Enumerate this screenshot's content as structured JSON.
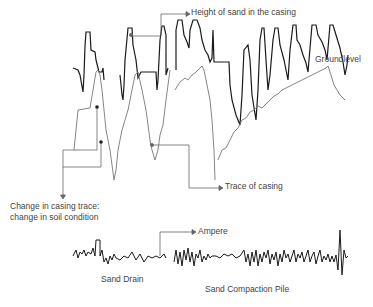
{
  "diagram": {
    "labels": {
      "height_of_sand": "Height of sand in the casing",
      "ground_level": "Groundlevel",
      "trace_of_casing": "Trace of casing",
      "change_line1": "Change in casing trace:",
      "change_line2": "change in soil condition",
      "ampere": "Ampere",
      "sand_drain": "Sand Drain",
      "sand_compaction_pile": "Sand Compaction Pile"
    },
    "colors": {
      "sand_trace": "#1a1a1a",
      "casing_trace": "#777777",
      "leader": "#666666",
      "text": "#444444"
    }
  }
}
